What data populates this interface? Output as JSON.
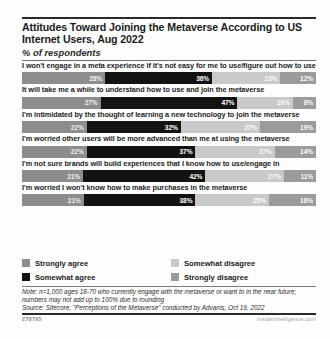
{
  "header": {
    "title": "Attitudes Toward Joining the Metaverse According to US Internet Users, Aug 2022",
    "subtitle": "% of respondents"
  },
  "notes": {
    "note": "Note: n=1,000 ages 18-70 who currently engage with the metaverse or want to in the near future; numbers may not add up to 100% due to rounding",
    "source": "Source: Sitecore, \"Perceptions of the Metaverse\" conducted by Advanis, Oct 19, 2022"
  },
  "footer": {
    "chart_id": "278795",
    "site": "insiderintelligence.com"
  },
  "colors": {
    "strongly_agree": "#8d8d8d",
    "somewhat_agree": "#131313",
    "somewhat_disagree": "#c9c9c9",
    "strongly_disagree": "#9b9b9b"
  },
  "chart_data": {
    "type": "bar",
    "title": "Attitudes Toward Joining the Metaverse According to US Internet Users, Aug 2022",
    "subtitle": "% of respondents",
    "xlabel": "",
    "ylabel": "",
    "xlim": [
      0,
      100
    ],
    "grid": false,
    "stacked": true,
    "orientation": "horizontal",
    "legend_position": "bottom",
    "categories": [
      "I won't engage in a meta experience if it's not easy for me to use/figure out how to use",
      "It will take me a while to understand how to use and join the metaverse",
      "I'm intimidated by the thought of learning a new technology to join the metaverse",
      "I'm worried other users will be more advanced than me at using the metaverse",
      "I'm not sure brands will build experiences that I know how to use/engage in",
      "I'm worried I won't know how to make purchases in the metaverse"
    ],
    "series": [
      {
        "name": "Strongly agree",
        "values": [
          28,
          27,
          22,
          22,
          21,
          21
        ],
        "labels": [
          "28%",
          "27%",
          "22%",
          "22%",
          "21%",
          "21%"
        ]
      },
      {
        "name": "Somewhat agree",
        "values": [
          36,
          47,
          32,
          37,
          42,
          38
        ],
        "labels": [
          "36%",
          "47%",
          "32%",
          "37%",
          "42%",
          "38%"
        ]
      },
      {
        "name": "Somewhat disagree",
        "values": [
          23,
          19,
          27,
          27,
          27,
          25
        ],
        "labels": [
          "23%",
          "19%",
          "27%",
          "27%",
          "27%",
          "25%"
        ]
      },
      {
        "name": "Strongly disagree",
        "values": [
          12,
          8,
          19,
          14,
          11,
          16
        ],
        "labels": [
          "12%",
          "8%",
          "19%",
          "14%",
          "11%",
          "16%"
        ]
      }
    ]
  }
}
